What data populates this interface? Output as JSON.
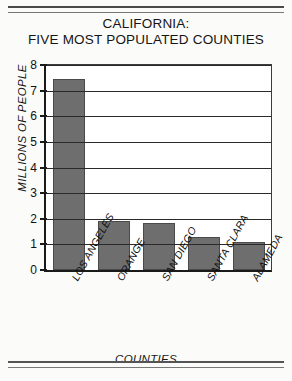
{
  "chart_data": {
    "type": "bar",
    "title": "CALIFORNIA: FIVE MOST POPULATED COUNTIES",
    "title_line1": "CALIFORNIA:",
    "title_line2": "FIVE MOST POPULATED COUNTIES",
    "xlabel": "COUNTIES",
    "ylabel": "MILLIONS OF PEOPLE",
    "categories": [
      "LOS ANGELES",
      "ORANGE",
      "SAN DIEGO",
      "SANTA CLARA",
      "ALAMEDA"
    ],
    "values": [
      7.45,
      1.9,
      1.85,
      1.3,
      1.1
    ],
    "ylim": [
      0,
      8
    ],
    "ytick_labels": [
      "8",
      "7",
      "6",
      "5",
      "4",
      "3",
      "2",
      "1",
      "0"
    ],
    "ytick_values": [
      8,
      7,
      6,
      5,
      4,
      3,
      2,
      1,
      0
    ],
    "ystep": 1,
    "grid": true,
    "legend": "none",
    "bar_color": "#6e6e6e",
    "axis_color": "#1a1a1a",
    "background_color": "#ffffff"
  }
}
